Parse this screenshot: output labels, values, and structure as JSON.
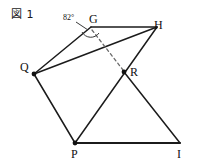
{
  "figure": {
    "caption": "図 1",
    "stroke_color": "#1b1b1b",
    "dash_color": "#6b6b6b",
    "background_color": "#ffffff",
    "width": 200,
    "height": 165
  },
  "angles": [
    {
      "id": "angle-at-G",
      "label": "82°",
      "value": 82,
      "unit": "degrees",
      "vertex": "G"
    }
  ],
  "points": [
    {
      "id": "G",
      "label": "G",
      "x": 91,
      "y": 27,
      "marker": false
    },
    {
      "id": "H",
      "label": "H",
      "x": 157,
      "y": 27,
      "marker": false
    },
    {
      "id": "Q",
      "label": "Q",
      "x": 34,
      "y": 74,
      "marker": true
    },
    {
      "id": "R",
      "label": "R",
      "x": 124,
      "y": 72,
      "marker": true
    },
    {
      "id": "P",
      "label": "P",
      "x": 75,
      "y": 143,
      "marker": true
    },
    {
      "id": "I",
      "label": "I",
      "x": 180,
      "y": 143,
      "marker": false
    }
  ],
  "segments": [
    {
      "id": "Q-G",
      "from": "Q",
      "to": "G",
      "style": "solid"
    },
    {
      "id": "G-H",
      "from": "G",
      "to": "H",
      "style": "solid"
    },
    {
      "id": "Q-H",
      "from": "Q",
      "to": "H",
      "style": "solid"
    },
    {
      "id": "Q-P",
      "from": "Q",
      "to": "P",
      "style": "solid"
    },
    {
      "id": "P-H",
      "from": "P",
      "to": "H",
      "style": "solid"
    },
    {
      "id": "R-I",
      "from": "R",
      "to": "I",
      "style": "solid"
    },
    {
      "id": "P-I",
      "from": "P",
      "to": "I",
      "style": "solid"
    },
    {
      "id": "G-R",
      "from": "G",
      "to": "R",
      "style": "dashed"
    }
  ]
}
